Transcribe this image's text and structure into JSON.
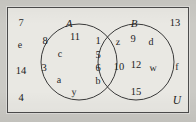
{
  "diagram": {
    "type": "venn",
    "title": "",
    "universe_label": "U",
    "sets": [
      {
        "id": "A",
        "label": "A"
      },
      {
        "id": "B",
        "label": "B"
      }
    ],
    "regions": {
      "a_only": {
        "name": "A only",
        "elements": [
          "8",
          "11",
          "c",
          "3",
          "a",
          "y"
        ]
      },
      "intersection": {
        "name": "A and B",
        "elements": [
          "1",
          "5",
          "6",
          "b"
        ]
      },
      "b_only": {
        "name": "B only",
        "elements": [
          "z",
          "9",
          "d",
          "10",
          "12",
          "w",
          "15"
        ]
      },
      "outside": {
        "name": "outside A and B",
        "elements": [
          "7",
          "e",
          "14",
          "4",
          "13",
          "f"
        ]
      }
    },
    "elements": [
      {
        "key": "e0",
        "text": "7",
        "region": "outside",
        "x": 21,
        "y": 24,
        "kind": "num"
      },
      {
        "key": "e1",
        "text": "e",
        "region": "outside",
        "x": 20,
        "y": 46,
        "kind": "letter"
      },
      {
        "key": "e2",
        "text": "14",
        "region": "outside",
        "x": 21,
        "y": 72,
        "kind": "num"
      },
      {
        "key": "e3",
        "text": "4",
        "region": "outside",
        "x": 21,
        "y": 99,
        "kind": "num"
      },
      {
        "key": "e4",
        "text": "13",
        "region": "outside",
        "x": 175,
        "y": 24,
        "kind": "num"
      },
      {
        "key": "e5",
        "text": "f",
        "region": "outside",
        "x": 177,
        "y": 68,
        "kind": "letter"
      },
      {
        "key": "e6",
        "text": "8",
        "region": "a_only",
        "x": 45,
        "y": 42,
        "kind": "num"
      },
      {
        "key": "e7",
        "text": "11",
        "region": "a_only",
        "x": 75,
        "y": 38,
        "kind": "num"
      },
      {
        "key": "e8",
        "text": "c",
        "region": "a_only",
        "x": 60,
        "y": 55,
        "kind": "letter"
      },
      {
        "key": "e9",
        "text": "3",
        "region": "a_only",
        "x": 44,
        "y": 69,
        "kind": "num"
      },
      {
        "key": "e10",
        "text": "a",
        "region": "a_only",
        "x": 59,
        "y": 81,
        "kind": "letter"
      },
      {
        "key": "e11",
        "text": "y",
        "region": "a_only",
        "x": 74,
        "y": 93,
        "kind": "letter"
      },
      {
        "key": "e12",
        "text": "1",
        "region": "intersection",
        "x": 98,
        "y": 42,
        "kind": "num"
      },
      {
        "key": "e13",
        "text": "5",
        "region": "intersection",
        "x": 98,
        "y": 56,
        "kind": "num"
      },
      {
        "key": "e14",
        "text": "6",
        "region": "intersection",
        "x": 98,
        "y": 69,
        "kind": "num"
      },
      {
        "key": "e15",
        "text": "b",
        "region": "intersection",
        "x": 98,
        "y": 82,
        "kind": "letter"
      },
      {
        "key": "e16",
        "text": "z",
        "region": "b_only",
        "x": 118,
        "y": 43,
        "kind": "letter"
      },
      {
        "key": "e17",
        "text": "9",
        "region": "b_only",
        "x": 133,
        "y": 40,
        "kind": "num"
      },
      {
        "key": "e18",
        "text": "d",
        "region": "b_only",
        "x": 151,
        "y": 43,
        "kind": "letter"
      },
      {
        "key": "e19",
        "text": "10",
        "region": "b_only",
        "x": 119,
        "y": 68,
        "kind": "num"
      },
      {
        "key": "e20",
        "text": "12",
        "region": "b_only",
        "x": 136,
        "y": 66,
        "kind": "num"
      },
      {
        "key": "e21",
        "text": "w",
        "region": "b_only",
        "x": 153,
        "y": 69,
        "kind": "letter"
      },
      {
        "key": "e22",
        "text": "15",
        "region": "b_only",
        "x": 136,
        "y": 93,
        "kind": "num"
      }
    ],
    "label_positions": {
      "A": {
        "x": 69,
        "y": 23
      },
      "B": {
        "x": 134,
        "y": 23
      },
      "U": {
        "x": 177,
        "y": 101
      }
    },
    "geometry": {
      "rect": {
        "x": 7,
        "y": 7,
        "w": 182,
        "h": 106
      },
      "circle_a": {
        "cx": 79,
        "cy": 62,
        "rx": 38,
        "ry": 38
      },
      "circle_b": {
        "cx": 136,
        "cy": 62,
        "rx": 38,
        "ry": 38
      }
    },
    "colors": {
      "background": "#cbcac5",
      "panel": "#e9e8e3",
      "border": "#4c4c4c",
      "stroke": "#3a3a3a",
      "text": "#232323"
    }
  }
}
